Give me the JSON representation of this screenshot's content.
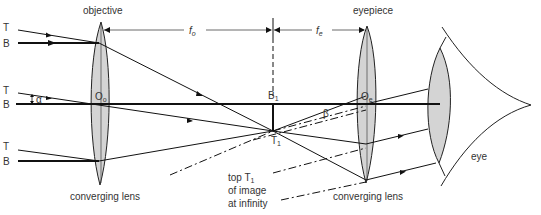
{
  "diagram": {
    "labels": {
      "objective": "objective",
      "eyepiece": "eyepiece",
      "converging_lens_left": "converging lens",
      "converging_lens_right": "converging lens",
      "eye": "eye",
      "focal_objective": "f",
      "focal_objective_sub": "o",
      "focal_eyepiece": "f",
      "focal_eyepiece_sub": "e",
      "top_ray_T_1": "T",
      "bottom_ray_B_1": "B",
      "top_ray_T_2": "T",
      "bottom_ray_B_2": "B",
      "top_ray_T_3": "T",
      "bottom_ray_B_3": "B",
      "alpha": "α",
      "beta": "β",
      "optical_centre_objective": "O",
      "optical_centre_objective_sub": "o",
      "optical_centre_eyepiece": "O",
      "optical_centre_eyepiece_sub": "e",
      "image_bottom": "B",
      "image_bottom_sub": "1",
      "image_top": "T",
      "image_top_sub": "1",
      "annotation_line1": "top T",
      "annotation_line1_sub": "1",
      "annotation_line2": "of image",
      "annotation_line3": "at infinity"
    },
    "colors": {
      "line": "#111111",
      "lens_fill": "#d4d4d4",
      "text": "#333333"
    }
  }
}
